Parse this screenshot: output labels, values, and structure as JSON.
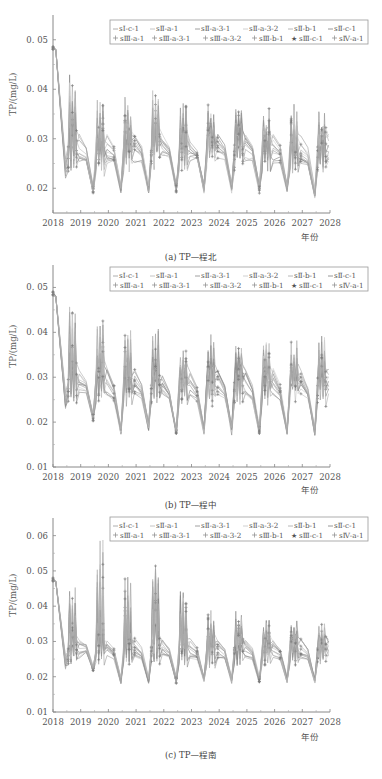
{
  "legend": {
    "row1": [
      "sⅠ-c-1",
      "sⅡ-a-1",
      "sⅡ-a-3-1",
      "sⅡ-a-3-2",
      "sⅡ-b-1",
      "sⅡ-c-1"
    ],
    "row2": [
      "sⅢ-a-1",
      "sⅢ-a-3-1",
      "sⅢ-a-3-2",
      "sⅢ-b-1",
      "sⅢ-c-1",
      "sⅣ-a-1"
    ]
  },
  "chart_data": [
    {
      "type": "line",
      "title": "(a) TP—程北",
      "xlabel": "年份",
      "ylabel": "TP/(mg/L)",
      "xlim": [
        2018,
        2028
      ],
      "ylim": [
        0.015,
        0.055
      ],
      "xticks": [
        "2018",
        "2019",
        "2020",
        "2021",
        "2022",
        "2023",
        "2024",
        "2025",
        "2026",
        "2027",
        "2028"
      ],
      "yticks": [
        "0.02",
        "0.03",
        "0.04",
        "0.05"
      ],
      "start_value": 0.049,
      "annual_peaks": [
        0.043,
        0.041,
        0.04,
        0.04,
        0.039,
        0.039,
        0.039,
        0.038,
        0.038,
        0.038
      ],
      "annual_troughs": [
        0.019,
        0.019,
        0.019,
        0.019,
        0.019,
        0.019,
        0.019,
        0.019,
        0.018,
        0.019
      ],
      "band_mid": 0.03,
      "legend_position": "top-right"
    },
    {
      "type": "line",
      "title": "(b) TP—程中",
      "xlabel": "年份",
      "ylabel": "TP/(mg/L)",
      "xlim": [
        2018,
        2028
      ],
      "ylim": [
        0.01,
        0.055
      ],
      "xticks": [
        "2018",
        "2019",
        "2020",
        "2021",
        "2022",
        "2023",
        "2024",
        "2025",
        "2026",
        "2027",
        "2028"
      ],
      "yticks": [
        "0.01",
        "0.02",
        "0.03",
        "0.04",
        "0.05"
      ],
      "start_value": 0.049,
      "annual_peaks": [
        0.049,
        0.044,
        0.042,
        0.042,
        0.037,
        0.04,
        0.039,
        0.039,
        0.039,
        0.04
      ],
      "annual_troughs": [
        0.02,
        0.017,
        0.018,
        0.017,
        0.017,
        0.017,
        0.017,
        0.017,
        0.017,
        0.017
      ],
      "band_mid": 0.031,
      "legend_position": "top-right"
    },
    {
      "type": "line",
      "title": "(c) TP—程南",
      "xlabel": "年份",
      "ylabel": "TP/(mg/L)",
      "xlim": [
        2018,
        2028
      ],
      "ylim": [
        0.01,
        0.065
      ],
      "xticks": [
        "2018",
        "2019",
        "2020",
        "2021",
        "2022",
        "2023",
        "2024",
        "2025",
        "2026",
        "2027",
        "2028"
      ],
      "yticks": [
        "0.01",
        "0.02",
        "0.03",
        "0.04",
        "0.05",
        "0.06"
      ],
      "start_value": 0.048,
      "annual_peaks": [
        0.049,
        0.061,
        0.049,
        0.053,
        0.047,
        0.041,
        0.04,
        0.039,
        0.038,
        0.037
      ],
      "annual_troughs": [
        0.021,
        0.018,
        0.018,
        0.018,
        0.018,
        0.018,
        0.018,
        0.018,
        0.018,
        0.018
      ],
      "band_mid": 0.03,
      "legend_position": "top-right"
    }
  ]
}
